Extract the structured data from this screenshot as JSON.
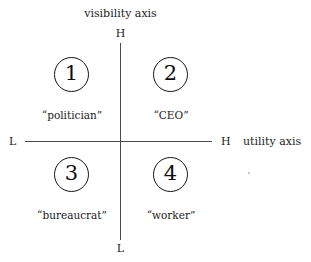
{
  "chart_data": {
    "type": "scatter",
    "title": "",
    "xlabel": "utility axis",
    "ylabel": "visibility axis",
    "x_ticks": [
      "L",
      "H"
    ],
    "y_ticks": [
      "L",
      "H"
    ],
    "grid": false,
    "legend": "none",
    "quadrants": [
      {
        "number": "1",
        "label": "“politician”",
        "visibility": "H",
        "utility": "L"
      },
      {
        "number": "2",
        "label": "“CEO”",
        "visibility": "H",
        "utility": "H"
      },
      {
        "number": "3",
        "label": "“bureaucrat”",
        "visibility": "L",
        "utility": "L"
      },
      {
        "number": "4",
        "label": "“worker”",
        "visibility": "L",
        "utility": "H"
      }
    ]
  },
  "axes": {
    "vertical": {
      "title": "visibility axis",
      "high_cap": "H",
      "low_cap": "L"
    },
    "horizontal": {
      "title": "utility axis",
      "low_cap": "L",
      "high_cap": "H"
    }
  },
  "quadrants": [
    {
      "number": "1",
      "label": "“politician”"
    },
    {
      "number": "2",
      "label": "“CEO”"
    },
    {
      "number": "3",
      "label": "“bureaucrat”"
    },
    {
      "number": "4",
      "label": "“worker”"
    }
  ],
  "colors": {
    "background": "#ffffff",
    "axis_line": "#4a4a4a",
    "circle_stroke": "#151515",
    "text": "#1a1a1a"
  }
}
